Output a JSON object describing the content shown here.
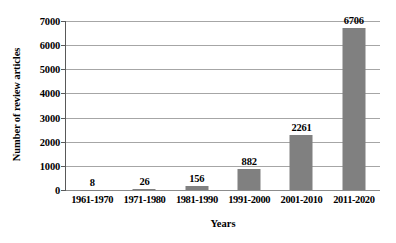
{
  "chart_data": {
    "type": "bar",
    "title": "",
    "subtitle": "",
    "xlabel": "Years",
    "ylabel": "Number of review articles",
    "categories": [
      "1961-1970",
      "1971-1980",
      "1981-1990",
      "1991-2000",
      "2001-2010",
      "2011-2020"
    ],
    "values": [
      8,
      26,
      156,
      882,
      2261,
      6706
    ],
    "data_labels": [
      "8",
      "26",
      "156",
      "882",
      "2261",
      "6706"
    ],
    "ylim": [
      0,
      7000
    ],
    "ytick_values": [
      0,
      1000,
      2000,
      3000,
      4000,
      5000,
      6000,
      7000
    ],
    "ytick_labels": [
      "0",
      "1000",
      "2000",
      "3000",
      "4000",
      "5000",
      "6000",
      "7000"
    ],
    "grid": "horizontal",
    "legend": "none",
    "bar_color": "#808080",
    "gridline_color": "#a6a6a6",
    "axis_color": "#595959",
    "background_color": "#ffffff",
    "text_color": "#000000"
  }
}
